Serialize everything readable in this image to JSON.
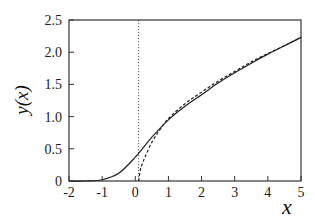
{
  "chart_data": {
    "type": "line",
    "title": "",
    "xlabel": "x",
    "ylabel": "y(x)",
    "xlim": [
      -2,
      5
    ],
    "ylim": [
      0,
      2.5
    ],
    "grid": false,
    "legend": null,
    "x_ticks": [
      "-2",
      "-1",
      "0",
      "1",
      "2",
      "3",
      "4",
      "5"
    ],
    "y_ticks": [
      "0",
      "0.5",
      "1.0",
      "1.5",
      "2.0",
      "2.5"
    ],
    "annotations": [
      {
        "type": "vertical-dotted-line",
        "x": 0.1
      }
    ],
    "series": [
      {
        "name": "solid",
        "style": "solid",
        "x": [
          -2,
          -1.5,
          -1,
          -0.5,
          0,
          0.5,
          1,
          1.5,
          2,
          2.5,
          3,
          3.5,
          4,
          4.5,
          5
        ],
        "y": [
          0,
          0.0,
          0.02,
          0.12,
          0.37,
          0.68,
          0.95,
          1.16,
          1.34,
          1.52,
          1.68,
          1.83,
          1.97,
          2.1,
          2.23
        ]
      },
      {
        "name": "dashed",
        "style": "dashed",
        "x": [
          0.1,
          0.15,
          0.2,
          0.3,
          0.5,
          0.75,
          1,
          1.5,
          2,
          2.5,
          3,
          3.5,
          4,
          4.5,
          5
        ],
        "y": [
          0,
          0.17,
          0.25,
          0.38,
          0.6,
          0.8,
          0.97,
          1.2,
          1.38,
          1.55,
          1.7,
          1.85,
          1.98,
          2.1,
          2.23
        ]
      }
    ]
  }
}
